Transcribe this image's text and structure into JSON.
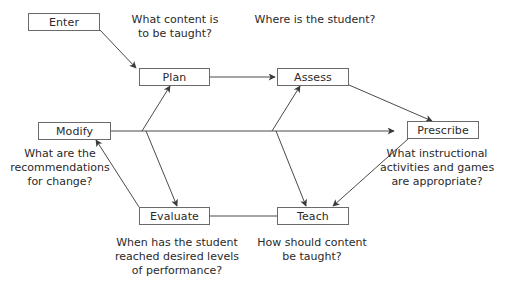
{
  "diagram": {
    "colors": {
      "line": "#4a4a4a",
      "box_border": "#6a6a6a",
      "text": "#2a2a2a",
      "background": "#ffffff"
    },
    "nodes": {
      "enter": {
        "label": "Enter"
      },
      "plan": {
        "label": "Plan"
      },
      "assess": {
        "label": "Assess"
      },
      "modify": {
        "label": "Modify"
      },
      "prescribe": {
        "label": "Prescribe"
      },
      "evaluate": {
        "label": "Evaluate"
      },
      "teach": {
        "label": "Teach"
      }
    },
    "questions": {
      "plan": "What content is\nto be taught?",
      "assess": "Where is the student?",
      "modify": "What are the\nrecommendations\nfor change?",
      "prescribe": "What instructional\nactivities and games\nare appropriate?",
      "evaluate": "When has the student\nreached desired levels\nof performance?",
      "teach": "How should content\nbe taught?"
    },
    "edges": [
      {
        "from": "Enter",
        "to": "Plan",
        "arrow": true
      },
      {
        "from": "Plan",
        "to": "Assess",
        "arrow": true
      },
      {
        "from": "Assess",
        "to": "Prescribe",
        "arrow": true
      },
      {
        "from": "Prescribe",
        "to": "Teach",
        "arrow": true
      },
      {
        "from": "Teach",
        "to": "Evaluate",
        "arrow": false
      },
      {
        "from": "Evaluate",
        "to": "Modify",
        "arrow": true
      },
      {
        "from": "Modify",
        "to": "Plan",
        "arrow": true
      },
      {
        "from": "Modify",
        "to": "Evaluate",
        "arrow": true
      },
      {
        "from": "Modify",
        "to": "Assess",
        "arrow": true
      },
      {
        "from": "Modify",
        "to": "Teach",
        "arrow": true
      },
      {
        "from": "Modify",
        "to": "Prescribe",
        "arrow": true
      }
    ]
  }
}
